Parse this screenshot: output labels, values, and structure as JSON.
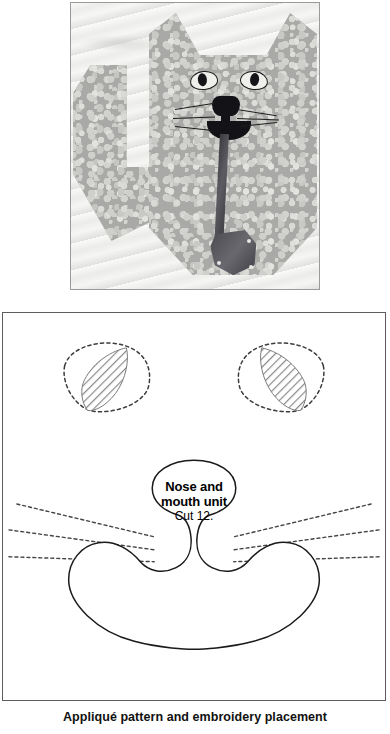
{
  "page": {
    "caption": "Appliqué pattern and embroidery placement",
    "background_color": "#ffffff"
  },
  "photo": {
    "alt_name": "cat-quilt-block-photograph",
    "description": "Grayscale photograph of a pieced and quilted cat block with pebble-print fabric, appliquéd face and a dark ribbon bow",
    "frame_color": "#9a9a9a",
    "background_color": "#f3f3f2",
    "fabric_color": "#a9a9a7",
    "ink_color": "#131317"
  },
  "diagram": {
    "alt_name": "applique-pattern-diagram",
    "border_color": "#5d5d5d",
    "background_color": "#ffffff",
    "line_color": "#1a1a1a",
    "hatch_color": "#8a8a8a",
    "nose_label": {
      "line1": "Nose and",
      "line2": "mouth unit",
      "line3": "Cut 12."
    },
    "parts": [
      {
        "name": "left-eye-placement-outline",
        "style": "dashed"
      },
      {
        "name": "left-eye-applique-piece",
        "style": "hatched"
      },
      {
        "name": "right-eye-placement-outline",
        "style": "dashed"
      },
      {
        "name": "right-eye-applique-piece",
        "style": "hatched"
      },
      {
        "name": "whisker-lines-left",
        "style": "dashed",
        "count": 3
      },
      {
        "name": "whisker-lines-right",
        "style": "dashed",
        "count": 3
      },
      {
        "name": "nose-and-mouth-unit",
        "style": "solid"
      }
    ]
  }
}
